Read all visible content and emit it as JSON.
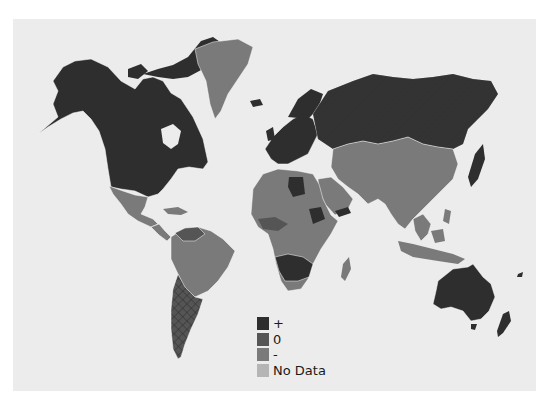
{
  "map": {
    "title": "",
    "colors": {
      "positive": "#2e2e2e",
      "zero": "#555555",
      "negative": "#7a7a7a",
      "no_data": "#b5b5b5",
      "ocean": "#ececec",
      "border": "#ffffff"
    },
    "regions": {
      "north_america_usa_canada": "positive",
      "alaska": "positive",
      "greenland": "negative",
      "mexico_central_america": "negative",
      "caribbean": "negative",
      "south_america_north": "negative",
      "venezuela_colombia": "zero",
      "brazil": "negative",
      "argentina_chile": "zero",
      "europe": "positive",
      "russia": "positive",
      "north_africa": "negative",
      "libya": "positive",
      "west_africa": "zero",
      "central_africa": "negative",
      "sudan_region": "positive",
      "southern_africa_angola_zambia": "positive",
      "south_africa": "negative",
      "madagascar": "negative",
      "middle_east": "negative",
      "central_asia": "negative",
      "china_india": "negative",
      "japan": "positive",
      "southeast_asia": "negative",
      "indonesia": "negative",
      "australia": "positive",
      "new_zealand": "positive"
    }
  },
  "legend": {
    "items": [
      {
        "label": "+",
        "color": "#2e2e2e"
      },
      {
        "label": "0",
        "color": "#555555"
      },
      {
        "label": "-",
        "color": "#7a7a7a"
      },
      {
        "label": "No Data",
        "color": "#b5b5b5"
      }
    ]
  }
}
